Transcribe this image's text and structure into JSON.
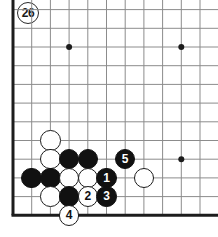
{
  "figure": {
    "number_label": "26",
    "kind": "go-board-diagram"
  },
  "board": {
    "grid_spacing": 18.7,
    "origin_x": 13,
    "origin_y": 9.6,
    "cols": 11,
    "rows": 12,
    "edges": {
      "left": true,
      "bottom": true,
      "top": false,
      "right": false
    },
    "line_color": "#8c8c8c",
    "edge_color": "#1c1c1c",
    "background_color": "#ffffff",
    "star_points": [
      {
        "col": 3,
        "row": 2
      },
      {
        "col": 9,
        "row": 2
      },
      {
        "col": 9,
        "row": 8
      }
    ]
  },
  "colors": {
    "black_stone": "#111111",
    "white_stone": "#ffffff",
    "stone_outline": "#1c1c1c",
    "black_label_text": "#ffffff",
    "white_label_text": "#111111"
  },
  "stones": [
    {
      "name": "white-stone-a",
      "color": "white",
      "col": 2,
      "row": 7,
      "label": ""
    },
    {
      "name": "white-stone-b",
      "color": "white",
      "col": 2,
      "row": 8,
      "label": ""
    },
    {
      "name": "black-stone-a",
      "color": "black",
      "col": 3,
      "row": 8,
      "label": ""
    },
    {
      "name": "black-stone-b",
      "color": "black",
      "col": 4,
      "row": 8,
      "label": ""
    },
    {
      "name": "move-5-stone",
      "color": "black",
      "col": 6,
      "row": 8,
      "label": "5"
    },
    {
      "name": "black-stone-c",
      "color": "black",
      "col": 1,
      "row": 9,
      "label": ""
    },
    {
      "name": "black-stone-d",
      "color": "black",
      "col": 2,
      "row": 9,
      "label": ""
    },
    {
      "name": "white-stone-c",
      "color": "white",
      "col": 3,
      "row": 9,
      "label": ""
    },
    {
      "name": "white-stone-d",
      "color": "white",
      "col": 4,
      "row": 9,
      "label": ""
    },
    {
      "name": "move-1-stone",
      "color": "black",
      "col": 5,
      "row": 9,
      "label": "1"
    },
    {
      "name": "white-stone-e",
      "color": "white",
      "col": 7,
      "row": 9,
      "label": ""
    },
    {
      "name": "white-stone-f",
      "color": "white",
      "col": 2,
      "row": 10,
      "label": ""
    },
    {
      "name": "black-stone-e",
      "color": "black",
      "col": 3,
      "row": 10,
      "label": ""
    },
    {
      "name": "move-2-stone",
      "color": "white",
      "col": 4,
      "row": 10,
      "label": "2"
    },
    {
      "name": "move-3-stone",
      "color": "black",
      "col": 5,
      "row": 10,
      "label": "3"
    },
    {
      "name": "move-4-stone",
      "color": "white",
      "col": 3,
      "row": 11,
      "label": "4"
    }
  ]
}
